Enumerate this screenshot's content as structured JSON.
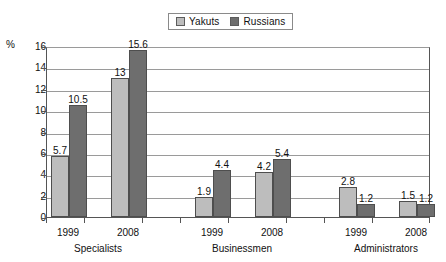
{
  "chart_data": {
    "type": "bar",
    "title": "",
    "subtitle": "",
    "xlabel": "",
    "ylabel": "%",
    "ylim": [
      0,
      16
    ],
    "ytick_labels": [
      "0",
      "2",
      "4",
      "6",
      "8",
      "10",
      "12",
      "14",
      "16"
    ],
    "ytick_values": [
      0,
      2,
      4,
      6,
      8,
      10,
      12,
      14,
      16
    ],
    "grid": true,
    "legend_position": "top-center",
    "groups": [
      {
        "name": "Specialists",
        "years": [
          {
            "year": "1999",
            "values": [
              {
                "series": "Yakuts",
                "value": 5.7,
                "label": "5.7"
              },
              {
                "series": "Russians",
                "value": 10.5,
                "label": "10.5"
              }
            ]
          },
          {
            "year": "2008",
            "values": [
              {
                "series": "Yakuts",
                "value": 13,
                "label": "13"
              },
              {
                "series": "Russians",
                "value": 15.6,
                "label": "15.6"
              }
            ]
          }
        ]
      },
      {
        "name": "Businessmen",
        "years": [
          {
            "year": "1999",
            "values": [
              {
                "series": "Yakuts",
                "value": 1.9,
                "label": "1.9"
              },
              {
                "series": "Russians",
                "value": 4.4,
                "label": "4.4"
              }
            ]
          },
          {
            "year": "2008",
            "values": [
              {
                "series": "Yakuts",
                "value": 4.2,
                "label": "4.2"
              },
              {
                "series": "Russians",
                "value": 5.4,
                "label": "5.4"
              }
            ]
          }
        ]
      },
      {
        "name": "Administrators",
        "years": [
          {
            "year": "1999",
            "values": [
              {
                "series": "Yakuts",
                "value": 2.8,
                "label": "2.8"
              },
              {
                "series": "Russians",
                "value": 1.2,
                "label": "1.2"
              }
            ]
          },
          {
            "year": "2008",
            "values": [
              {
                "series": "Yakuts",
                "value": 1.5,
                "label": "1.5"
              },
              {
                "series": "Russians",
                "value": 1.2,
                "label": "1.2"
              }
            ]
          }
        ]
      }
    ],
    "series": [
      {
        "name": "Yakuts",
        "color": "#bdbdbd",
        "values": [
          5.7,
          13,
          1.9,
          4.2,
          2.8,
          1.5
        ]
      },
      {
        "name": "Russians",
        "color": "#6e6e6e",
        "values": [
          10.5,
          15.6,
          4.4,
          5.4,
          1.2,
          1.2
        ]
      }
    ],
    "categories": [
      "Specialists 1999",
      "Specialists 2008",
      "Businessmen 1999",
      "Businessmen 2008",
      "Administrators 1999",
      "Administrators 2008"
    ]
  },
  "legend": {
    "entries": [
      {
        "label": "Yakuts",
        "color": "#bdbdbd"
      },
      {
        "label": "Russians",
        "color": "#6e6e6e"
      }
    ]
  },
  "axis": {
    "unit_label": "%"
  },
  "colors": {
    "yakuts": "#bdbdbd",
    "russians": "#6e6e6e",
    "grid": "#9a9a9a",
    "axis": "#555555",
    "text": "#111111"
  }
}
